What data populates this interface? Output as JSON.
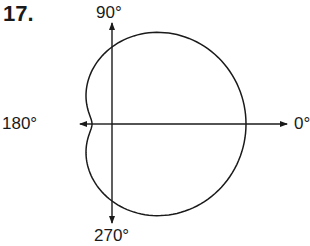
{
  "problem_number": "17.",
  "axis_labels": {
    "top": "90°",
    "left": "180°",
    "right": "0°",
    "bottom": "270°"
  },
  "colors": {
    "stroke": "#1a1a1a",
    "background": "#ffffff"
  },
  "curve": {
    "type": "limacon",
    "equation": "r = a + b cos θ",
    "shape": "dimpled limaçon (cardioid-like)",
    "origin_px": [
      112,
      124
    ],
    "a_px": 77,
    "b_px": 57,
    "intercepts_px": {
      "right_0deg": 134,
      "left_180deg": 20,
      "top_90deg": 74,
      "bottom_270deg": 74
    }
  }
}
